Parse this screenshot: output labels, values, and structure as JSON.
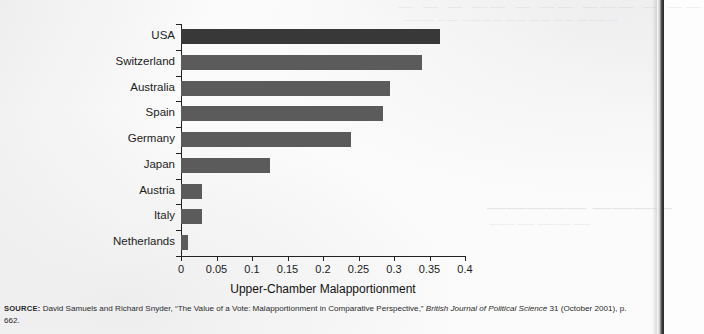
{
  "chart_data": {
    "type": "bar",
    "orientation": "horizontal",
    "title": "",
    "xlabel": "Upper-Chamber Malapportionment",
    "ylabel": "",
    "categories": [
      "USA",
      "Switzerland",
      "Australia",
      "Spain",
      "Germany",
      "Japan",
      "Austria",
      "Italy",
      "Netherlands"
    ],
    "values": [
      0.365,
      0.34,
      0.295,
      0.285,
      0.24,
      0.125,
      0.03,
      0.03,
      0.01
    ],
    "highlight_category": "USA",
    "xlim": [
      0,
      0.4
    ],
    "xticks": [
      0,
      0.05,
      0.1,
      0.15,
      0.2,
      0.25,
      0.3,
      0.35,
      0.4
    ],
    "xticklabels": [
      "0",
      "0.05",
      "0.1",
      "0.15",
      "0.2",
      "0.25",
      "0.3",
      "0.35",
      "0.4"
    ],
    "grid": false,
    "legend": null,
    "bar_color": "#5b5b5b",
    "highlight_color": "#383838"
  },
  "source": {
    "label": "SOURCE:",
    "text_before_italic": " David Samuels and Richard Snyder, “The Value of a Vote: Malapportionment in Comparative Perspective,” ",
    "italic_text": "British Journal of Political Science",
    "text_after_italic": " 31 (October 2001), p. 662."
  },
  "bleedthrough": {
    "header_ghost": "—  —  —   ——  — ——  ———  —  ——",
    "header_ghost_line2": "——— —— ———— —— —— —— ————",
    "title_ghost": "————— ————",
    "sub_ghost": "——— —— ———— ——"
  }
}
